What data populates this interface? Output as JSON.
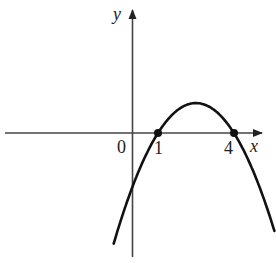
{
  "chart_data": {
    "type": "line",
    "title": "",
    "xlabel": "x",
    "ylabel": "y",
    "function": "y = -(x-1)(x-4)",
    "origin_label": "0",
    "tick_labels": [
      "1",
      "4"
    ],
    "roots": [
      1,
      4
    ],
    "vertex": [
      2.5,
      2.25
    ],
    "y_intercept": -4,
    "x": [
      -0.75,
      -0.5,
      0,
      0.5,
      1,
      1.5,
      2,
      2.5,
      3,
      3.5,
      4,
      4.5,
      5.6
    ],
    "values": [
      -8.06,
      -6.75,
      -4,
      -1.75,
      0,
      1.25,
      2,
      2.25,
      2,
      1.25,
      0,
      -1.75,
      -8.16
    ],
    "highlighted_points": [
      [
        1,
        0
      ],
      [
        4,
        0
      ]
    ],
    "xlim": [
      -5.1,
      5.2
    ],
    "ylim": [
      -9.3,
      9.2
    ],
    "grid": false,
    "legend": null,
    "colors": {
      "curve": "#111111",
      "axes": "#444444",
      "background": "#ffffff"
    }
  },
  "labels": {
    "x_axis": "x",
    "y_axis": "y",
    "origin": "0",
    "tick_1": "1",
    "tick_4": "4"
  }
}
